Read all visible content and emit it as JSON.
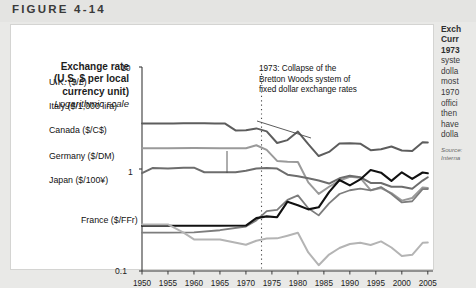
{
  "figure": {
    "label": "FIGURE 4-14"
  },
  "axis_title": {
    "line1": "Exchange rate",
    "line2": "(U.S. $ per local",
    "line3": "currency unit)",
    "scale_note": "Logarithmic scale"
  },
  "annotation": {
    "line1": "1973: Collapse of the",
    "line2": "Bretton Woods system of",
    "line3": "fixed dollar exchange rates",
    "year": 1973
  },
  "side_panel": {
    "title_line1": "Exch",
    "title_line2": "Curr",
    "title_line3": "1973",
    "body": [
      "syste",
      "dolla",
      "most",
      "1970",
      "offici",
      "then",
      "have",
      "dolla"
    ],
    "source": [
      "Source:",
      "Interna"
    ]
  },
  "chart_data": {
    "type": "line",
    "title": "",
    "xlabel": "",
    "ylabel": "Exchange rate (U.S. $ per local currency unit)",
    "yscale": "log",
    "ylim": [
      0.1,
      10
    ],
    "ytick_labels": [
      "10",
      "1",
      "0.1"
    ],
    "ytick_values": [
      10,
      1,
      0.1
    ],
    "xlim": [
      1950,
      2006
    ],
    "xtick_labels": [
      "1950",
      "1955",
      "1960",
      "1965",
      "1970",
      "1975",
      "1980",
      "1985",
      "1990",
      "1995",
      "2000",
      "2005"
    ],
    "grid": false,
    "legend": "inline-labels",
    "annotations": [
      {
        "x": 1973,
        "text": "1973: Collapse of the Bretton Woods system of fixed dollar exchange rates",
        "style": "dotted-vertical"
      }
    ],
    "series": [
      {
        "name": "U.K. ($/£)",
        "label": "U.K. ($/£)",
        "color": "#5d5d5d",
        "width": 2.0,
        "x": [
          1950,
          1952,
          1954,
          1956,
          1958,
          1960,
          1962,
          1964,
          1966,
          1968,
          1970,
          1972,
          1974,
          1976,
          1978,
          1980,
          1982,
          1984,
          1986,
          1988,
          1990,
          1992,
          1994,
          1996,
          1998,
          2000,
          2002,
          2004,
          2005
        ],
        "values": [
          2.8,
          2.79,
          2.8,
          2.8,
          2.81,
          2.81,
          2.81,
          2.79,
          2.79,
          2.39,
          2.4,
          2.5,
          2.34,
          1.8,
          1.92,
          2.33,
          1.75,
          1.34,
          1.47,
          1.78,
          1.79,
          1.77,
          1.53,
          1.56,
          1.66,
          1.52,
          1.5,
          1.83,
          1.82
        ]
      },
      {
        "name": "Italy ($/1,000 lira)",
        "label": "Italy ($/1,000 lira)",
        "color": "#9a9a9a",
        "width": 2.0,
        "x": [
          1950,
          1955,
          1960,
          1965,
          1970,
          1972,
          1974,
          1976,
          1978,
          1980,
          1982,
          1984,
          1986,
          1988,
          1990,
          1992,
          1994,
          1996,
          1998,
          2000,
          2002,
          2004,
          2005
        ],
        "values": [
          1.6,
          1.6,
          1.61,
          1.6,
          1.6,
          1.71,
          1.54,
          1.2,
          1.18,
          1.17,
          0.74,
          0.57,
          0.67,
          0.77,
          0.84,
          0.82,
          0.62,
          0.65,
          0.58,
          0.49,
          0.52,
          0.66,
          0.65
        ]
      },
      {
        "name": "Canada ($/C$)",
        "label": "Canada ($/C$)",
        "color": "#6d6d6d",
        "width": 2.0,
        "x": [
          1950,
          1952,
          1955,
          1958,
          1960,
          1962,
          1964,
          1966,
          1968,
          1970,
          1972,
          1974,
          1976,
          1978,
          1980,
          1982,
          1984,
          1986,
          1988,
          1990,
          1992,
          1994,
          1996,
          1998,
          2000,
          2002,
          2004,
          2005
        ],
        "values": [
          0.91,
          1.02,
          1.01,
          1.03,
          1.03,
          0.93,
          0.93,
          0.93,
          0.93,
          0.96,
          1.01,
          1.02,
          1.01,
          0.88,
          0.85,
          0.81,
          0.77,
          0.72,
          0.81,
          0.86,
          0.83,
          0.73,
          0.73,
          0.67,
          0.67,
          0.64,
          0.77,
          0.83
        ]
      },
      {
        "name": "Germany ($/DM)",
        "label": "Germany ($/DM)",
        "color": "#7d7d7d",
        "width": 1.8,
        "x": [
          1950,
          1955,
          1960,
          1965,
          1970,
          1972,
          1974,
          1976,
          1978,
          1980,
          1982,
          1984,
          1986,
          1988,
          1990,
          1992,
          1994,
          1996,
          1998,
          2000,
          2002,
          2004,
          2005
        ],
        "values": [
          0.238,
          0.238,
          0.239,
          0.251,
          0.273,
          0.313,
          0.386,
          0.397,
          0.498,
          0.551,
          0.412,
          0.351,
          0.46,
          0.569,
          0.619,
          0.641,
          0.617,
          0.665,
          0.568,
          0.47,
          0.483,
          0.634,
          0.637
        ]
      },
      {
        "name": "Japan ($/100¥)",
        "label": "Japan ($/100¥)",
        "color": "#111111",
        "width": 2.1,
        "x": [
          1950,
          1955,
          1960,
          1965,
          1970,
          1972,
          1974,
          1976,
          1978,
          1980,
          1982,
          1984,
          1986,
          1988,
          1990,
          1992,
          1994,
          1996,
          1998,
          2000,
          2002,
          2004,
          2005
        ],
        "values": [
          0.278,
          0.278,
          0.278,
          0.278,
          0.279,
          0.33,
          0.343,
          0.337,
          0.478,
          0.442,
          0.402,
          0.421,
          0.593,
          0.78,
          0.691,
          0.79,
          0.978,
          0.92,
          0.765,
          0.928,
          0.799,
          0.924,
          0.909
        ]
      },
      {
        "name": "France ($/FFr)",
        "label": "France ($/FFr)",
        "color": "#b4b4b4",
        "width": 2.0,
        "x": [
          1950,
          1955,
          1958,
          1960,
          1965,
          1970,
          1972,
          1974,
          1976,
          1978,
          1980,
          1982,
          1984,
          1986,
          1988,
          1990,
          1992,
          1994,
          1996,
          1998,
          2000,
          2002,
          2004,
          2005
        ],
        "values": [
          0.286,
          0.286,
          0.238,
          0.204,
          0.204,
          0.181,
          0.198,
          0.208,
          0.209,
          0.222,
          0.237,
          0.152,
          0.114,
          0.145,
          0.168,
          0.184,
          0.189,
          0.18,
          0.195,
          0.17,
          0.14,
          0.144,
          0.189,
          0.19
        ]
      }
    ]
  },
  "series_labels": [
    {
      "text": "U.K. ($/£)",
      "left": 38,
      "top": 52
    },
    {
      "text": "Italy ($/1,000 lira)",
      "left": 38,
      "top": 76
    },
    {
      "text": "Canada ($/C$)",
      "left": 38,
      "top": 100
    },
    {
      "text": "Germany ($/DM)",
      "left": 38,
      "top": 126
    },
    {
      "text": "Japan ($/100¥)",
      "left": 38,
      "top": 150
    },
    {
      "text": "France ($/FFr)",
      "left": 70,
      "top": 190
    }
  ]
}
